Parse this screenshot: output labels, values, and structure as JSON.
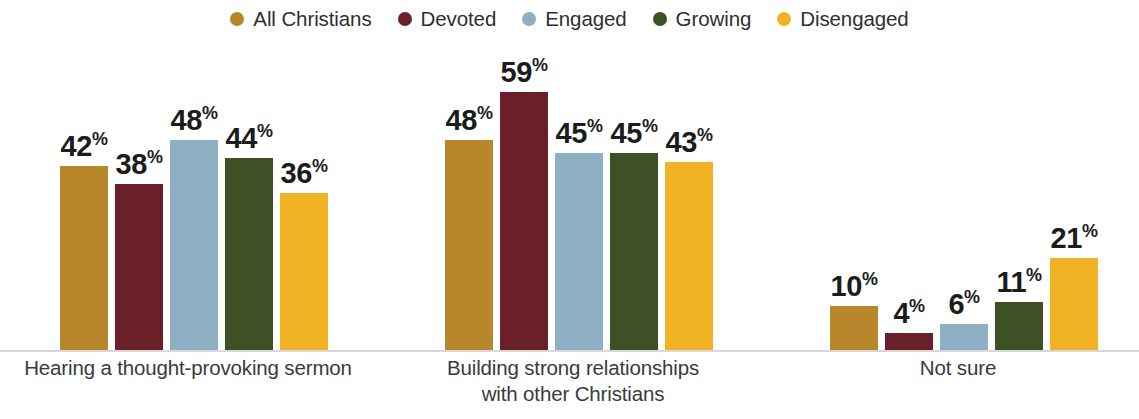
{
  "legend": {
    "items": [
      {
        "label": "All Christians",
        "color": "#B8862B"
      },
      {
        "label": "Devoted",
        "color": "#6B2029"
      },
      {
        "label": "Engaged",
        "color": "#8FAFC4"
      },
      {
        "label": "Growing",
        "color": "#3E5124"
      },
      {
        "label": "Disengaged",
        "color": "#F0B323"
      }
    ]
  },
  "chart_data": {
    "type": "bar",
    "title": "",
    "xlabel": "",
    "ylabel": "",
    "ylim": [
      0,
      60
    ],
    "grid": false,
    "legend_position": "top-center",
    "value_suffix": "%",
    "categories": [
      "Hearing a thought-provoking sermon",
      "Building strong relationships with other Christians",
      "Not sure"
    ],
    "categories_lines": [
      [
        "Hearing a thought-provoking sermon"
      ],
      [
        "Building strong relationships",
        "with other Christians"
      ],
      [
        "Not sure"
      ]
    ],
    "series": [
      {
        "name": "All Christians",
        "color": "#B8862B",
        "values": [
          42,
          48,
          10
        ]
      },
      {
        "name": "Devoted",
        "color": "#6B2029",
        "values": [
          38,
          59,
          4
        ]
      },
      {
        "name": "Engaged",
        "color": "#8FAFC4",
        "values": [
          48,
          45,
          6
        ]
      },
      {
        "name": "Growing",
        "color": "#3E5124",
        "values": [
          44,
          45,
          11
        ]
      },
      {
        "name": "Disengaged",
        "color": "#F0B323",
        "values": [
          36,
          43,
          21
        ]
      }
    ],
    "labels": [
      [
        "42%",
        "38%",
        "48%",
        "44%",
        "36%"
      ],
      [
        "48%",
        "59%",
        "45%",
        "45%",
        "43%"
      ],
      [
        "10%",
        "4%",
        "6%",
        "11%",
        "21%"
      ]
    ]
  },
  "layout": {
    "group_left_px": [
      60,
      445,
      830
    ],
    "px_per_unit": 4.37,
    "baseline_top_px": 310,
    "bar_width_px": 48,
    "bar_gap_px": 7,
    "cat_label_centers_px": [
      188,
      573,
      958
    ]
  }
}
